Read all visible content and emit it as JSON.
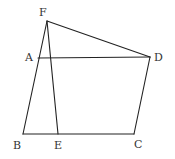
{
  "diagram": {
    "type": "geometry-figure",
    "points": {
      "F": "F",
      "A": "A",
      "D": "D",
      "B": "B",
      "E": "E",
      "C": "C"
    },
    "segments": [
      "FB",
      "FE",
      "FD",
      "AD",
      "DC",
      "BC"
    ]
  }
}
